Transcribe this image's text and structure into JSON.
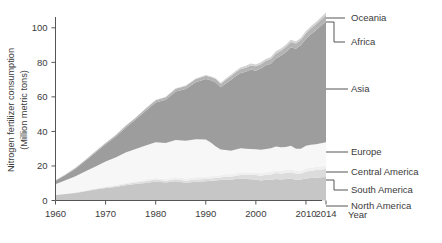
{
  "chart_data": {
    "type": "area",
    "title": "",
    "xlabel": "Year",
    "ylabel": "Nitrogen fertilizer consumption (Million metric tons)",
    "ylabel_line1": "Nitrogen fertilizer consumption",
    "ylabel_line2": "(Million metric tons)",
    "xlim": [
      1960,
      2014
    ],
    "ylim": [
      0,
      108
    ],
    "xticks": [
      1960,
      1970,
      1980,
      1990,
      2000,
      2010,
      2014
    ],
    "xtick_labels": [
      "1960",
      "1970",
      "1980",
      "1990",
      "2000",
      "2010",
      "2014"
    ],
    "yticks": [
      0,
      20,
      40,
      60,
      80,
      100
    ],
    "ytick_labels": [
      "0",
      "20",
      "40",
      "60",
      "80",
      "100"
    ],
    "grid": false,
    "stacked": true,
    "legend_position": "right-outside-leader-lines",
    "x": [
      1960,
      1962,
      1964,
      1966,
      1968,
      1970,
      1972,
      1974,
      1976,
      1978,
      1980,
      1982,
      1984,
      1986,
      1988,
      1990,
      1991,
      1992,
      1993,
      1994,
      1995,
      1996,
      1997,
      1998,
      1999,
      2000,
      2001,
      2002,
      2003,
      2004,
      2005,
      2006,
      2007,
      2008,
      2009,
      2010,
      2011,
      2012,
      2013,
      2014
    ],
    "series": [
      {
        "name": "North America",
        "color": "#c6c6c6",
        "values": [
          3.2,
          3.8,
          4.4,
          5.4,
          6.4,
          7.2,
          7.8,
          8.8,
          9.6,
          10.2,
          11.0,
          10.4,
          11.2,
          10.3,
          10.8,
          11.2,
          11.4,
          11.6,
          11.8,
          12.2,
          12.0,
          12.4,
          12.6,
          12.4,
          12.3,
          12.2,
          11.6,
          12.0,
          11.8,
          12.4,
          12.2,
          12.4,
          12.6,
          12.0,
          12.2,
          12.8,
          13.0,
          13.2,
          13.4,
          13.6
        ]
      },
      {
        "name": "South America",
        "color": "#dcdcdc",
        "values": [
          0.1,
          0.15,
          0.2,
          0.25,
          0.35,
          0.45,
          0.55,
          0.7,
          0.85,
          1.0,
          1.1,
          1.0,
          1.1,
          1.2,
          1.3,
          1.3,
          1.3,
          1.4,
          1.5,
          1.7,
          1.8,
          2.0,
          2.2,
          2.3,
          2.4,
          2.6,
          2.7,
          2.9,
          3.2,
          3.5,
          3.4,
          3.5,
          3.8,
          3.6,
          3.4,
          4.0,
          4.2,
          4.4,
          4.6,
          4.8
        ]
      },
      {
        "name": "Central America",
        "color": "#efefef",
        "values": [
          0.1,
          0.15,
          0.2,
          0.3,
          0.4,
          0.5,
          0.6,
          0.7,
          0.8,
          0.9,
          1.0,
          1.1,
          1.2,
          1.3,
          1.4,
          1.4,
          1.3,
          1.3,
          1.3,
          1.4,
          1.4,
          1.4,
          1.5,
          1.5,
          1.5,
          1.5,
          1.5,
          1.5,
          1.6,
          1.6,
          1.6,
          1.7,
          1.7,
          1.7,
          1.6,
          1.7,
          1.7,
          1.8,
          1.8,
          1.8
        ]
      },
      {
        "name": "Europe",
        "color": "#f7f7f7",
        "values": [
          6.0,
          7.6,
          9.2,
          11.0,
          12.6,
          14.4,
          16.0,
          17.6,
          18.6,
          19.8,
          20.6,
          20.8,
          21.6,
          21.8,
          22.0,
          21.4,
          19.6,
          17.0,
          15.0,
          14.0,
          13.6,
          13.8,
          14.0,
          13.8,
          13.6,
          13.4,
          13.6,
          13.4,
          13.6,
          13.8,
          13.6,
          13.4,
          13.6,
          12.6,
          12.8,
          13.2,
          13.4,
          13.2,
          13.4,
          13.6
        ]
      },
      {
        "name": "Asia",
        "color": "#9d9d9d",
        "values": [
          2.0,
          3.0,
          4.4,
          6.0,
          8.0,
          10.0,
          12.0,
          14.4,
          17.0,
          20.0,
          23.0,
          25.0,
          28.0,
          30.0,
          33.0,
          35.0,
          36.0,
          37.0,
          36.0,
          38.5,
          41.0,
          42.5,
          43.5,
          44.5,
          46.0,
          45.5,
          47.0,
          48.5,
          49.0,
          51.0,
          53.0,
          55.0,
          57.0,
          58.0,
          60.0,
          62.0,
          64.0,
          66.0,
          68.0,
          70.0
        ]
      },
      {
        "name": "Africa",
        "color": "#b4b4b4",
        "values": [
          0.3,
          0.4,
          0.5,
          0.6,
          0.7,
          0.8,
          0.9,
          1.0,
          1.1,
          1.3,
          1.4,
          1.5,
          1.6,
          1.7,
          1.8,
          1.9,
          1.9,
          2.0,
          2.0,
          2.1,
          2.2,
          2.2,
          2.3,
          2.4,
          2.4,
          2.5,
          2.5,
          2.6,
          2.7,
          2.8,
          2.9,
          3.0,
          3.1,
          3.0,
          3.1,
          3.2,
          3.3,
          3.4,
          3.5,
          3.6
        ]
      },
      {
        "name": "Oceania",
        "color": "#d2d2d2",
        "values": [
          0.05,
          0.06,
          0.07,
          0.08,
          0.1,
          0.12,
          0.14,
          0.16,
          0.18,
          0.2,
          0.22,
          0.24,
          0.3,
          0.35,
          0.4,
          0.45,
          0.5,
          0.55,
          0.6,
          0.7,
          0.8,
          0.9,
          1.0,
          1.1,
          1.2,
          1.1,
          1.2,
          1.1,
          1.2,
          1.3,
          1.3,
          1.2,
          1.3,
          1.2,
          1.1,
          1.2,
          1.3,
          1.3,
          1.4,
          1.4
        ]
      }
    ],
    "labels_right": [
      {
        "name": "Oceania",
        "y": 18
      },
      {
        "name": "Africa",
        "y": 42
      },
      {
        "name": "Asia",
        "y": 89
      },
      {
        "name": "Europe",
        "y": 152
      },
      {
        "name": "Central America",
        "y": 172
      },
      {
        "name": "South America",
        "y": 190
      },
      {
        "name": "North America",
        "y": 206
      }
    ]
  },
  "colors": {
    "axis": "#555555",
    "text": "#3b3b3b",
    "background": "#ffffff"
  }
}
